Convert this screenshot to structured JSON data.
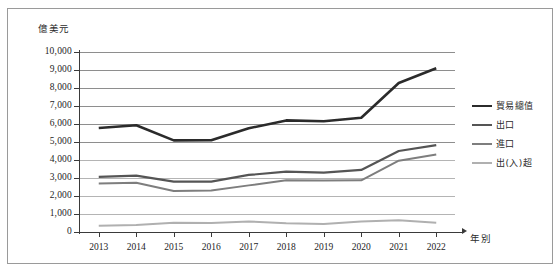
{
  "chart_data": {
    "type": "line",
    "title": "",
    "xlabel": "年別",
    "ylabel": "億美元",
    "ylim": [
      0,
      10000
    ],
    "ytick_step": 1000,
    "grid": true,
    "legend_position": "right",
    "categories": [
      "2013",
      "2014",
      "2015",
      "2016",
      "2017",
      "2018",
      "2019",
      "2020",
      "2021",
      "2022"
    ],
    "ytick_labels": [
      "10,000",
      "9,000",
      "8,000",
      "7,000",
      "6,000",
      "5,000",
      "4,000",
      "3,000",
      "2,000",
      "1,000",
      "0"
    ],
    "series": [
      {
        "name": "貿易總值",
        "color": "#2b2b2b",
        "width": 2.6,
        "values": [
          5780,
          5930,
          5090,
          5100,
          5760,
          6200,
          6150,
          6350,
          8280,
          9100
        ]
      },
      {
        "name": "出口",
        "color": "#555555",
        "width": 2.2,
        "values": [
          3060,
          3130,
          2800,
          2800,
          3170,
          3350,
          3300,
          3450,
          4500,
          4830
        ]
      },
      {
        "name": "進口",
        "color": "#7e7e7e",
        "width": 2.0,
        "values": [
          2700,
          2740,
          2280,
          2300,
          2590,
          2870,
          2860,
          2870,
          3960,
          4300
        ]
      },
      {
        "name": "出(入)超",
        "color": "#b0b0b0",
        "width": 2.0,
        "values": [
          350,
          390,
          520,
          500,
          580,
          490,
          450,
          580,
          650,
          520
        ]
      }
    ]
  },
  "axis": {
    "y_unit_label": "億美元",
    "x_unit_label": "年別"
  },
  "legend": {
    "items": [
      {
        "label": "貿易總值",
        "color": "#2b2b2b"
      },
      {
        "label": "出口",
        "color": "#555555"
      },
      {
        "label": "進口",
        "color": "#7e7e7e"
      },
      {
        "label": "出(入)超",
        "color": "#b0b0b0"
      }
    ]
  },
  "colors": {
    "frame": "#9a9a9a",
    "grid": "#8e8e8e",
    "axis": "#3a3a3a",
    "background": "#ffffff"
  }
}
